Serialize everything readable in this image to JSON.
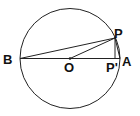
{
  "diagram": {
    "type": "geometry",
    "colors": {
      "stroke": "#222222",
      "background": "#ffffff",
      "text": "#111111"
    },
    "circle": {
      "cx": 70,
      "cy": 58.5,
      "r": 50
    },
    "points": {
      "B": {
        "label": "B",
        "x": 20,
        "y": 58.5
      },
      "A": {
        "label": "A",
        "x": 120,
        "y": 58.5
      },
      "O": {
        "label": "O",
        "x": 70,
        "y": 58.5
      },
      "P": {
        "label": "P",
        "x": 115,
        "y": 38
      },
      "P_prime": {
        "label": "P'",
        "x": 115,
        "y": 58.5
      }
    },
    "segments": [
      "BA",
      "BP",
      "OP",
      "PP'",
      "PA"
    ]
  }
}
